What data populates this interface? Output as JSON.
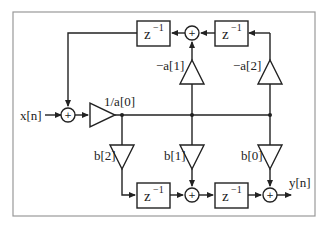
{
  "diagram": {
    "input_label": "x[n]",
    "output_label": "y[n]",
    "input_gain": "1/a[0]",
    "delay_label": "z",
    "delay_exponent": "−1",
    "sum_symbol": "+",
    "feedback_gains": [
      "−a[1]",
      "−a[2]"
    ],
    "feedforward_gains": [
      "b[2]",
      "b[1]",
      "b[0]"
    ],
    "colors": {
      "line": "#222222",
      "frame": "#999999",
      "background": "#ffffff"
    }
  }
}
